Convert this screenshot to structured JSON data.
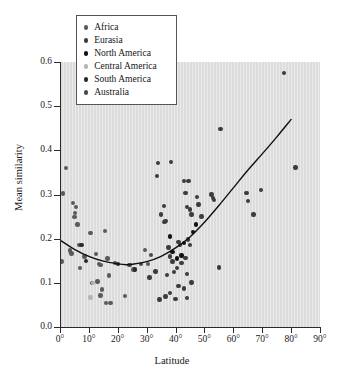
{
  "chart_data": {
    "type": "scatter",
    "title": "",
    "xlabel": "Latitude",
    "ylabel": "Mean similarity",
    "xlim": [
      0,
      90
    ],
    "ylim": [
      0.0,
      0.6
    ],
    "grid": false,
    "background_color": "#dcdcdc",
    "legend_position": "top-left",
    "xticks": [
      "0°",
      "10°",
      "20°",
      "30°",
      "40°",
      "50°",
      "60°",
      "70°",
      "80°",
      "90°"
    ],
    "xtick_values": [
      0,
      10,
      20,
      30,
      40,
      50,
      60,
      70,
      80,
      90
    ],
    "yticks": [
      "0.0",
      "0.1",
      "0.2",
      "0.3",
      "0.4",
      "0.5",
      "0.6"
    ],
    "ytick_values": [
      0.0,
      0.1,
      0.2,
      0.3,
      0.4,
      0.5,
      0.6
    ],
    "series": [
      {
        "name": "Africa",
        "color": "#5a5a5a",
        "points": [
          [
            2.0,
            0.36
          ],
          [
            1.0,
            0.302
          ],
          [
            0.5,
            0.148
          ],
          [
            4.5,
            0.281
          ],
          [
            5.5,
            0.272
          ],
          [
            5.2,
            0.258
          ],
          [
            5.0,
            0.249
          ],
          [
            6.0,
            0.232
          ],
          [
            3.5,
            0.173
          ],
          [
            4.0,
            0.166
          ],
          [
            6.5,
            0.186
          ],
          [
            7.0,
            0.134
          ],
          [
            8.5,
            0.16
          ],
          [
            10.5,
            0.213
          ],
          [
            11.0,
            0.1
          ],
          [
            12.5,
            0.165
          ],
          [
            13.5,
            0.143
          ],
          [
            14.0,
            0.141
          ],
          [
            14.5,
            0.085
          ],
          [
            13.0,
            0.103
          ],
          [
            15.5,
            0.218
          ],
          [
            16.5,
            0.155
          ],
          [
            17.0,
            0.117
          ],
          [
            14.0,
            0.071
          ],
          [
            16.0,
            0.054
          ],
          [
            17.5,
            0.054
          ],
          [
            22.5,
            0.07
          ],
          [
            25.5,
            0.13
          ],
          [
            29.5,
            0.175
          ],
          [
            30.5,
            0.143
          ]
        ]
      },
      {
        "name": "Eurasia",
        "color": "#3c3c3c",
        "points": [
          [
            31.0,
            0.112
          ],
          [
            33.0,
            0.126
          ],
          [
            33.5,
            0.342
          ],
          [
            34.0,
            0.372
          ],
          [
            35.0,
            0.255
          ],
          [
            36.0,
            0.274
          ],
          [
            36.5,
            0.24
          ],
          [
            36.2,
            0.238
          ],
          [
            38.5,
            0.373
          ],
          [
            37.5,
            0.18
          ],
          [
            38.0,
            0.16
          ],
          [
            39.0,
            0.148
          ],
          [
            39.5,
            0.124
          ],
          [
            37.0,
            0.118
          ],
          [
            38.0,
            0.077
          ],
          [
            34.5,
            0.062
          ],
          [
            36.5,
            0.069
          ],
          [
            41.0,
            0.192
          ],
          [
            41.5,
            0.186
          ],
          [
            42.0,
            0.145
          ],
          [
            40.5,
            0.133
          ],
          [
            41.0,
            0.093
          ],
          [
            40.0,
            0.064
          ],
          [
            43.0,
            0.33
          ],
          [
            43.5,
            0.304
          ],
          [
            44.5,
            0.33
          ],
          [
            44.0,
            0.272
          ],
          [
            45.0,
            0.266
          ],
          [
            45.5,
            0.255
          ],
          [
            44.2,
            0.198
          ],
          [
            45.0,
            0.186
          ],
          [
            43.5,
            0.156
          ],
          [
            44.0,
            0.12
          ],
          [
            45.5,
            0.101
          ],
          [
            43.0,
            0.087
          ],
          [
            44.0,
            0.066
          ],
          [
            47.5,
            0.295
          ],
          [
            48.0,
            0.277
          ],
          [
            49.0,
            0.25
          ],
          [
            52.5,
            0.3
          ],
          [
            53.0,
            0.292
          ],
          [
            53.2,
            0.288
          ],
          [
            55.0,
            0.135
          ],
          [
            55.5,
            0.448
          ],
          [
            64.5,
            0.303
          ],
          [
            65.0,
            0.285
          ],
          [
            67.0,
            0.255
          ],
          [
            69.5,
            0.31
          ],
          [
            77.5,
            0.575
          ],
          [
            81.5,
            0.361
          ]
        ]
      },
      {
        "name": "North America",
        "color": "#111111",
        "points": [
          [
            38.0,
            0.205
          ],
          [
            39.0,
            0.17
          ],
          [
            40.5,
            0.155
          ],
          [
            42.0,
            0.162
          ],
          [
            43.0,
            0.19
          ],
          [
            46.0,
            0.215
          ],
          [
            47.0,
            0.232
          ]
        ]
      },
      {
        "name": "Central America",
        "color": "#b4b4b4",
        "points": [
          [
            10.5,
            0.067
          ],
          [
            11.5,
            0.1
          ]
        ]
      },
      {
        "name": "South America",
        "color": "#2a2a2a",
        "points": [
          [
            7.5,
            0.185
          ],
          [
            9.0,
            0.15
          ],
          [
            20.0,
            0.143
          ],
          [
            26.0,
            0.13
          ]
        ]
      },
      {
        "name": "Australia",
        "color": "#4a4a4a",
        "points": [
          [
            19.0,
            0.145
          ],
          [
            24.0,
            0.14
          ],
          [
            28.0,
            0.142
          ],
          [
            31.5,
            0.163
          ]
        ]
      }
    ],
    "fit_curve": {
      "label": "quadratic fit",
      "color": "#111111",
      "points": [
        [
          0,
          0.197
        ],
        [
          5,
          0.176
        ],
        [
          10,
          0.16
        ],
        [
          15,
          0.149
        ],
        [
          20,
          0.143
        ],
        [
          23,
          0.141
        ],
        [
          25,
          0.142
        ],
        [
          30,
          0.148
        ],
        [
          35,
          0.16
        ],
        [
          40,
          0.179
        ],
        [
          45,
          0.204
        ],
        [
          50,
          0.237
        ],
        [
          55,
          0.275
        ],
        [
          60,
          0.315
        ],
        [
          65,
          0.355
        ],
        [
          70,
          0.392
        ],
        [
          75,
          0.43
        ],
        [
          80,
          0.47
        ]
      ]
    }
  },
  "legend": {
    "items": [
      {
        "label": "Africa",
        "color": "#5a5a5a"
      },
      {
        "label": "Eurasia",
        "color": "#3c3c3c"
      },
      {
        "label": "North America",
        "color": "#111111"
      },
      {
        "label": "Central America",
        "color": "#b4b4b4"
      },
      {
        "label": "South America",
        "color": "#2a2a2a"
      },
      {
        "label": "Australia",
        "color": "#4a4a4a"
      }
    ]
  }
}
